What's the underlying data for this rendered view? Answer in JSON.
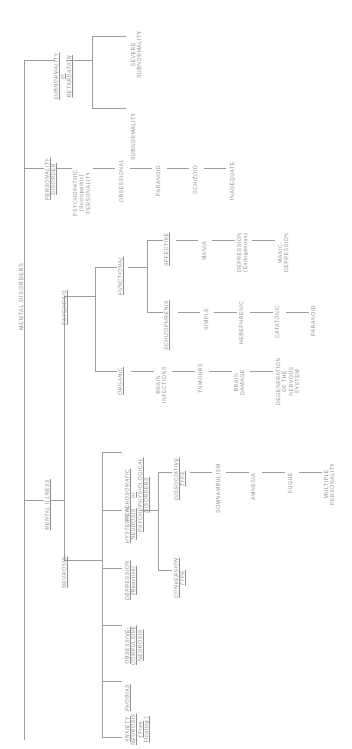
{
  "diagram": {
    "title": "MENTAL DISORDERS",
    "type": "hierarchical-tree",
    "orientation": "rotated-90-counterclockwise",
    "root": {
      "label": "MENTAL DISORDERS"
    },
    "level1": [
      {
        "id": "subnormality",
        "label_lines": [
          "SUBNORMALITY",
          "or",
          "RETARDATION"
        ],
        "style": "italic-underline"
      },
      {
        "id": "personality-disorder",
        "label_lines": [
          "PERSONALITY",
          "DISORDER"
        ],
        "style": "italic-underline"
      },
      {
        "id": "mental-illness",
        "label_lines": [
          "MENTAL ILLNESS"
        ],
        "style": "italic-underline"
      }
    ],
    "subnormality_children": [
      {
        "label_lines": [
          "SEVERE",
          "SUBNORMALITY"
        ]
      },
      {
        "label_lines": [
          "SUBNORMALITY"
        ]
      }
    ],
    "personality_disorder_chain": [
      {
        "label_lines": [
          "PSYCHOPATHIC",
          "(Sociopathic)",
          "PERSONALITY"
        ]
      },
      {
        "label_lines": [
          "OBSESSIONAL"
        ]
      },
      {
        "label_lines": [
          "PARANOID"
        ]
      },
      {
        "label_lines": [
          "SCHIZOID"
        ]
      },
      {
        "label_lines": [
          "INADEQUATE"
        ]
      }
    ],
    "mental_illness_children": [
      {
        "id": "psychosis",
        "label_lines": [
          "PSYCHOSIS"
        ],
        "style": "italic-underline"
      },
      {
        "id": "neurosis",
        "label_lines": [
          "NEUROSIS"
        ],
        "style": "italic-underline"
      }
    ],
    "psychosis_children": [
      {
        "id": "functional",
        "label_lines": [
          "FUNCTIONAL"
        ],
        "style": "italic-underline"
      },
      {
        "id": "organic",
        "label_lines": [
          "ORGANIC"
        ],
        "style": "italic-underline"
      }
    ],
    "functional_children": [
      {
        "id": "affective",
        "label_lines": [
          "AFFECTIVE"
        ],
        "style": "italic-underline"
      },
      {
        "id": "schizophrenia",
        "label_lines": [
          "SCHIZOPHRENIA"
        ],
        "style": "italic-underline"
      }
    ],
    "affective_chain": [
      {
        "label_lines": [
          "MANIA"
        ]
      },
      {
        "label_lines": [
          "DEPRESSION",
          "(Endogenous)"
        ]
      },
      {
        "label_lines": [
          "MANIC-",
          "DEPRESSION"
        ]
      }
    ],
    "schizophrenia_chain": [
      {
        "label_lines": [
          "SIMPLE"
        ]
      },
      {
        "label_lines": [
          "HEBEPHRENIC"
        ]
      },
      {
        "label_lines": [
          "CATATONIC"
        ]
      },
      {
        "label_lines": [
          "PARANOID"
        ]
      }
    ],
    "organic_chain": [
      {
        "label_lines": [
          "BRAIN",
          "INFECTIONS"
        ]
      },
      {
        "label_lines": [
          "TUMOURS"
        ]
      },
      {
        "label_lines": [
          "BRAIN",
          "DAMAGE"
        ]
      },
      {
        "label_lines": [
          "DEGENERATION",
          "OF THE",
          "NERVOUS",
          "SYSTEM"
        ]
      }
    ],
    "neurosis_children": [
      {
        "id": "psychosomatic",
        "label_lines": [
          "PSYCHOSOMATIC",
          "or",
          "PSYCHOPHYSIOLOGICAL",
          "DISORDERS"
        ],
        "style": "italic-underline"
      },
      {
        "id": "hysterical-neurosis",
        "label_lines": [
          "HYSTERICAL",
          "NEUROSIS"
        ],
        "style": "italic-underline"
      },
      {
        "id": "depression-reactive",
        "label_lines": [
          "DEPRESSION",
          "(Reactive)"
        ],
        "style": "italic-underline"
      },
      {
        "id": "obsessive-compulsive",
        "label_lines": [
          "OBSESSIVE-",
          "COMPULSIVE",
          "NEUROSIS"
        ],
        "style": "italic-underline"
      },
      {
        "id": "phobias",
        "label_lines": [
          "PHOBIAS"
        ],
        "style": "italic-underline"
      },
      {
        "id": "anxiety-neurosis",
        "label_lines": [
          "ANXIETY",
          "NEUROSIS",
          "('Free",
          "Floating')"
        ],
        "style": "italic-underline"
      }
    ],
    "hysterical_children": [
      {
        "id": "dissociative-type",
        "label_lines": [
          "DISSOCIATIVE",
          "TYPE"
        ],
        "style": "italic-underline"
      },
      {
        "id": "conversion-type",
        "label_lines": [
          "CONVERSION",
          "TYPE"
        ],
        "style": "italic-underline"
      }
    ],
    "dissociative_chain": [
      {
        "label_lines": [
          "SOMNAMBULISM"
        ]
      },
      {
        "label_lines": [
          "AMNESIA"
        ]
      },
      {
        "label_lines": [
          "FUGUE"
        ]
      },
      {
        "label_lines": [
          "MULTIPLE",
          "PERSONALITY"
        ]
      }
    ],
    "colors": {
      "line": "#9d9d9d",
      "text": "#8e8e8e",
      "background": "#ffffff"
    }
  }
}
